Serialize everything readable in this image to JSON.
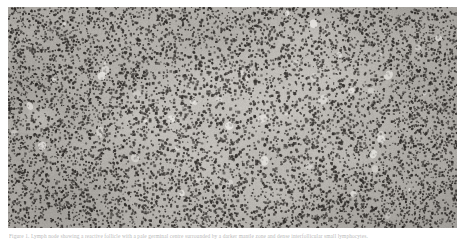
{
  "figure": {
    "kind": "histology-micrograph",
    "modality": "light-microscopy",
    "stain": "hematoxylin-and-eosin",
    "rendering": "grayscale",
    "caption": "Figure 1. Lymph node showing a reactive follicle with a pale germinal centre surrounded by a darker mantle zone and dense interfollicular small lymphocytes.",
    "plate": {
      "left": 8,
      "top": 7,
      "width": 449,
      "height": 221,
      "border": "none",
      "background_hex": "#9a9a9a"
    },
    "page_background_hex": "#ffffff",
    "caption_color_hex": "#b9b9b9"
  },
  "micrograph": {
    "width": 449,
    "height": 221,
    "tone": {
      "background_light_hex": "#d8d5d0",
      "background_mid_hex": "#a9a6a1",
      "background_dark_hex": "#7e7b77",
      "nucleus_dark_hex": "#2a2724",
      "nucleus_mid_hex": "#55514d",
      "highlight_hex": "#f2f0ec"
    },
    "regions": [
      {
        "name": "germinal-center",
        "description": "pale central follicle with sparser larger nuclei",
        "cx": 0.52,
        "cy": 0.52,
        "rx": 0.3,
        "ry": 0.42,
        "lightness": 0.82,
        "nucleus_density": 0.52,
        "nucleus_size": 2.5
      },
      {
        "name": "mantle-zone-left",
        "description": "dark dense small lymphocytes at left margin",
        "cx": 0.1,
        "cy": 0.5,
        "rx": 0.22,
        "ry": 0.7,
        "lightness": 0.52,
        "nucleus_density": 1.0,
        "nucleus_size": 1.9
      },
      {
        "name": "interfollicular-right",
        "description": "dense dark lymphocyte band at right margin",
        "cx": 0.92,
        "cy": 0.46,
        "rx": 0.2,
        "ry": 0.75,
        "lightness": 0.56,
        "nucleus_density": 0.95,
        "nucleus_size": 1.9
      },
      {
        "name": "dark-corner-lower-right",
        "description": "densest hyperchromatic cluster at bottom-right corner",
        "cx": 0.9,
        "cy": 0.9,
        "rx": 0.18,
        "ry": 0.22,
        "lightness": 0.42,
        "nucleus_density": 1.15,
        "nucleus_size": 1.9
      },
      {
        "name": "interfollicular-top",
        "description": "moderately dense band across the top",
        "cx": 0.45,
        "cy": 0.04,
        "rx": 0.6,
        "ry": 0.16,
        "lightness": 0.62,
        "nucleus_density": 0.92,
        "nucleus_size": 2.0
      },
      {
        "name": "interfollicular-bottom",
        "description": "moderately dense band across the bottom",
        "cx": 0.45,
        "cy": 0.98,
        "rx": 0.65,
        "ry": 0.18,
        "lightness": 0.6,
        "nucleus_density": 0.95,
        "nucleus_size": 2.0
      },
      {
        "name": "pale-vessel-left",
        "description": "small pale clearing in left field",
        "cx": 0.07,
        "cy": 0.5,
        "rx": 0.035,
        "ry": 0.055,
        "lightness": 0.96,
        "nucleus_density": 0.12,
        "nucleus_size": 2.2
      },
      {
        "name": "pale-clearing-upper-right",
        "description": "pale sinus-like clearing upper right of follicle",
        "cx": 0.7,
        "cy": 0.12,
        "rx": 0.07,
        "ry": 0.06,
        "lightness": 0.92,
        "nucleus_density": 0.35,
        "nucleus_size": 2.2
      }
    ],
    "texture": {
      "seed": 20240517,
      "base_nuclei_count": 12000,
      "vignette": 0.12,
      "grain": 0.1,
      "blur_px": 0.35
    }
  }
}
